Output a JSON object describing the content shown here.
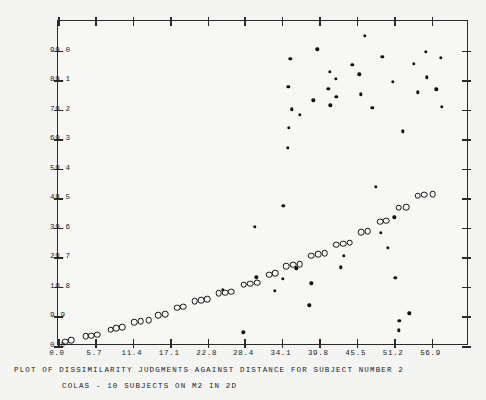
{
  "chart_data": {
    "type": "scatter",
    "title": "PLOT OF DISSIMILARITY JUDGMENTS AGAINST DISTANCE FOR SUBJECT NUMBER    2",
    "subtitle": "COLAS - 10 SUBJECTS ON M2 IN 2D",
    "xlabel": "",
    "ylabel": "",
    "grid": false,
    "legend": "none",
    "xlim": [
      0.0,
      62.6
    ],
    "ylim": [
      0.0,
      108.9
    ],
    "xticks": [
      "0.0",
      "5.7",
      "11.4",
      "17.1",
      "22.8",
      "28.4",
      "34.1",
      "39.8",
      "45.5",
      "51.2",
      "56.9"
    ],
    "xtick_values": [
      0.0,
      5.7,
      11.4,
      17.1,
      22.8,
      28.4,
      34.1,
      39.8,
      45.5,
      51.2,
      56.9
    ],
    "yticks": [
      "0.0",
      "9.9",
      "19.8",
      "29.7",
      "39.6",
      "49.5",
      "59.4",
      "69.3",
      "79.2",
      "89.1",
      "99.0"
    ],
    "ytick_values": [
      0.0,
      9.9,
      19.8,
      29.7,
      39.6,
      49.5,
      59.4,
      69.3,
      79.2,
      89.1,
      99.0
    ],
    "series": [
      {
        "name": "fitted-monotone-values",
        "marker": "open-circle",
        "points": [
          [
            1.1,
            1.5
          ],
          [
            2.0,
            1.9
          ],
          [
            4.2,
            3.2
          ],
          [
            5.1,
            3.5
          ],
          [
            6.0,
            3.8
          ],
          [
            8.0,
            5.5
          ],
          [
            8.9,
            5.9
          ],
          [
            9.8,
            6.2
          ],
          [
            11.6,
            8.0
          ],
          [
            12.6,
            8.4
          ],
          [
            13.8,
            8.6
          ],
          [
            15.3,
            10.4
          ],
          [
            16.3,
            10.7
          ],
          [
            18.2,
            12.8
          ],
          [
            19.1,
            13.1
          ],
          [
            20.8,
            15.0
          ],
          [
            21.8,
            15.3
          ],
          [
            22.7,
            15.6
          ],
          [
            24.5,
            17.6
          ],
          [
            25.5,
            17.9
          ],
          [
            26.4,
            18.2
          ],
          [
            28.3,
            20.6
          ],
          [
            29.3,
            20.9
          ],
          [
            30.3,
            21.2
          ],
          [
            32.2,
            23.9
          ],
          [
            33.1,
            24.3
          ],
          [
            34.8,
            26.8
          ],
          [
            35.8,
            27.2
          ],
          [
            36.8,
            27.5
          ],
          [
            38.6,
            30.3
          ],
          [
            39.6,
            30.7
          ],
          [
            40.6,
            31.0
          ],
          [
            42.4,
            33.9
          ],
          [
            43.4,
            34.3
          ],
          [
            44.4,
            34.6
          ],
          [
            46.2,
            38.1
          ],
          [
            47.2,
            38.4
          ],
          [
            49.1,
            41.7
          ],
          [
            50.0,
            42.0
          ],
          [
            51.9,
            46.3
          ],
          [
            53.0,
            46.6
          ],
          [
            54.8,
            50.4
          ],
          [
            55.8,
            50.7
          ],
          [
            57.1,
            50.9
          ]
        ]
      },
      {
        "name": "observed-dissimilarity-judgments",
        "marker": "filled-dot",
        "points": [
          [
            25.1,
            18.9
          ],
          [
            28.2,
            4.6
          ],
          [
            30.2,
            23.0
          ],
          [
            30.0,
            39.9
          ],
          [
            33.0,
            18.5
          ],
          [
            34.2,
            22.5
          ],
          [
            34.3,
            46.9
          ],
          [
            35.2,
            73.1
          ],
          [
            35.6,
            79.3
          ],
          [
            35.4,
            96.2
          ],
          [
            35.1,
            86.8
          ],
          [
            35.0,
            66.5
          ],
          [
            36.3,
            26.0
          ],
          [
            36.8,
            77.5
          ],
          [
            38.3,
            13.7
          ],
          [
            38.6,
            21.0
          ],
          [
            38.9,
            82.3
          ],
          [
            39.5,
            99.4
          ],
          [
            41.2,
            86.1
          ],
          [
            41.4,
            91.9
          ],
          [
            41.5,
            80.7
          ],
          [
            42.3,
            89.5
          ],
          [
            42.4,
            83.4
          ],
          [
            43.5,
            30.3
          ],
          [
            43.1,
            26.4
          ],
          [
            44.8,
            94.3
          ],
          [
            45.9,
            91.0
          ],
          [
            46.1,
            84.4
          ],
          [
            46.7,
            104.0
          ],
          [
            47.9,
            79.9
          ],
          [
            48.4,
            53.3
          ],
          [
            49.2,
            37.9
          ],
          [
            49.4,
            97.0
          ],
          [
            50.2,
            33.0
          ],
          [
            51.0,
            88.6
          ],
          [
            51.2,
            43.1
          ],
          [
            51.4,
            22.8
          ],
          [
            51.9,
            5.2
          ],
          [
            52.0,
            8.5
          ],
          [
            52.5,
            72.0
          ],
          [
            53.5,
            11.0
          ],
          [
            54.2,
            94.5
          ],
          [
            54.8,
            85.0
          ],
          [
            56.0,
            98.5
          ],
          [
            56.2,
            90.0
          ],
          [
            57.6,
            86.0
          ],
          [
            58.3,
            96.5
          ],
          [
            58.5,
            80.1
          ]
        ]
      }
    ]
  },
  "axes": {
    "x_tick_count": 11,
    "y_tick_count": 11
  },
  "colors": {
    "ink": "#1a1a1a",
    "frame": "#2b2b2b",
    "paper": "#f4f4f2",
    "plot_background": "#f7f7f5"
  }
}
